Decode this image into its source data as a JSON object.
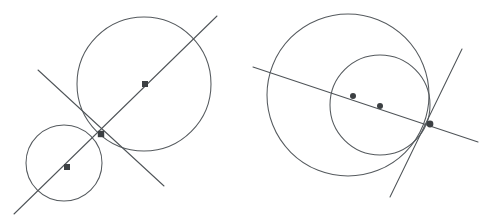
{
  "figure": {
    "background_color": "#ffffff",
    "curve_color": "#555a5e",
    "line_color": "#4f5458",
    "point_color": "#3c4043",
    "stroke_width": 1.05,
    "width": 490,
    "height": 222
  },
  "panels": [
    {
      "id": "left-panel",
      "name": "externally-tangent-circles",
      "description": "Two externally tangent circles with a common tangent line at the tangency point and the line of centers",
      "circles": [
        {
          "name": "large-circle",
          "cx": 144,
          "cy": 84,
          "r": 67,
          "center_marker": true
        },
        {
          "name": "small-circle",
          "cx": 64,
          "cy": 163,
          "r": 38,
          "center_marker": true
        }
      ],
      "points": [
        {
          "name": "large-circle-center",
          "x": 145,
          "y": 84,
          "radius": 3.0,
          "shape": "square-dot"
        },
        {
          "name": "small-circle-center",
          "x": 67,
          "y": 167,
          "radius": 3.0,
          "shape": "square-dot"
        },
        {
          "name": "tangency-point",
          "x": 101,
          "y": 134,
          "radius": 3.2,
          "shape": "square-dot"
        }
      ],
      "lines": [
        {
          "name": "line-of-centers",
          "x1": 14,
          "y1": 214,
          "x2": 217,
          "y2": 16
        },
        {
          "name": "common-tangent-line",
          "x1": 38,
          "y1": 70,
          "x2": 164,
          "y2": 186
        }
      ]
    },
    {
      "id": "right-panel",
      "name": "internally-tangent-circles",
      "description": "Two internally tangent circles with a common tangent line at the tangency point and the line of centers",
      "circles": [
        {
          "name": "outer-circle",
          "cx": 348,
          "cy": 95,
          "r": 81,
          "center_marker": false
        },
        {
          "name": "inner-circle",
          "cx": 380,
          "cy": 105,
          "r": 50,
          "center_marker": false
        }
      ],
      "points": [
        {
          "name": "outer-circle-center",
          "x": 353,
          "y": 96,
          "radius": 3.0,
          "shape": "round-dot"
        },
        {
          "name": "inner-circle-center",
          "x": 380,
          "y": 106,
          "radius": 3.0,
          "shape": "round-dot"
        },
        {
          "name": "tangency-point",
          "x": 430,
          "y": 124,
          "radius": 3.4,
          "shape": "round-dot"
        }
      ],
      "lines": [
        {
          "name": "line-of-centers",
          "x1": 253,
          "y1": 67,
          "x2": 478,
          "y2": 142
        },
        {
          "name": "common-tangent-line",
          "x1": 462,
          "y1": 49,
          "x2": 390,
          "y2": 197
        }
      ]
    }
  ]
}
